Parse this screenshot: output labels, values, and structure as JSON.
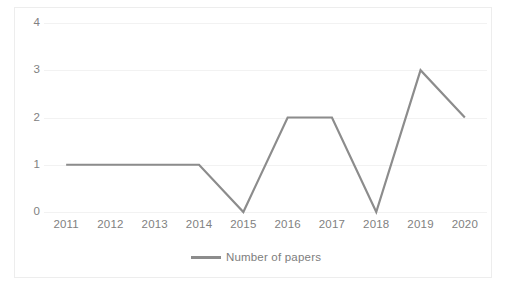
{
  "chart_data": {
    "type": "line",
    "title": "",
    "subtitle": "",
    "xlabel": "",
    "ylabel": "",
    "categories": [
      "2011",
      "2012",
      "2013",
      "2014",
      "2015",
      "2016",
      "2017",
      "2018",
      "2019",
      "2020"
    ],
    "series": [
      {
        "name": "Number of papers",
        "values": [
          1,
          1,
          1,
          1,
          0,
          2,
          2,
          0,
          3,
          2
        ],
        "color": "#8c8c8c",
        "markers": false,
        "line_width": 2.2
      }
    ],
    "ylim": [
      0,
      4
    ],
    "ytick_labels": [
      "0",
      "1",
      "2",
      "3",
      "4"
    ],
    "ytick_values": [
      0,
      1,
      2,
      3,
      4
    ],
    "grid": {
      "horizontal": true,
      "vertical": false,
      "color": "#f2f2f2"
    },
    "legend": {
      "position": "bottom-center",
      "entries": [
        "Number of papers"
      ]
    },
    "axis_label_color": "#818181",
    "plot_background": "#ffffff",
    "border_color": "#ededed"
  }
}
